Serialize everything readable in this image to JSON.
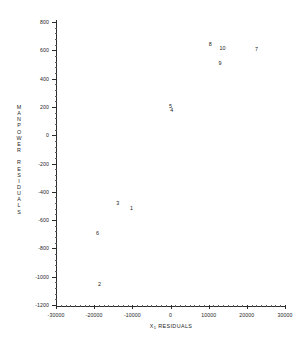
{
  "chart_data": {
    "type": "scatter",
    "title": "",
    "xlabel": "X₁ RESIDUALS",
    "xlabel_base": "X",
    "xlabel_sub": "1",
    "xlabel_rest": " RESIDUALS",
    "ylabel": "MANPOWER RESIDUALS",
    "ylabel_letters": [
      "M",
      "A",
      "N",
      "P",
      "O",
      "W",
      "E",
      "R",
      "",
      "R",
      "E",
      "S",
      "I",
      "D",
      "U",
      "A",
      "L",
      "S"
    ],
    "xlim": [
      -30000,
      30000
    ],
    "ylim": [
      -1200,
      800
    ],
    "xticks": [
      -30000,
      -20000,
      -10000,
      0,
      10000,
      20000,
      30000
    ],
    "xticklabels": [
      "-30000",
      "-20000",
      "-10000",
      "0",
      "10000",
      "20000",
      "30000"
    ],
    "yticks": [
      800,
      600,
      400,
      200,
      0,
      -200,
      -400,
      -600,
      -800,
      -1000,
      -1200
    ],
    "yticklabels": [
      "800",
      "600",
      "400",
      "200",
      "0",
      "-200",
      "-400",
      "-600",
      "-800",
      "-1000",
      "-1200"
    ],
    "x_minor_tick_count": 5,
    "y_minor_tick_count": 5,
    "grid": false,
    "legend": false,
    "marker_style": "text-label",
    "points": [
      {
        "label": "1",
        "x": -10200,
        "y": -515
      },
      {
        "label": "2",
        "x": -18600,
        "y": -1050
      },
      {
        "label": "3",
        "x": -13800,
        "y": -480
      },
      {
        "label": "4",
        "x": 300,
        "y": 180
      },
      {
        "label": "5",
        "x": 0,
        "y": 208
      },
      {
        "label": "6",
        "x": -19100,
        "y": -690
      },
      {
        "label": "7",
        "x": 22500,
        "y": 610
      },
      {
        "label": "8",
        "x": 10400,
        "y": 643
      },
      {
        "label": "9",
        "x": 13000,
        "y": 508
      },
      {
        "label": "10",
        "x": 13600,
        "y": 618
      }
    ]
  },
  "colors": {
    "background": "#ffffff",
    "axis": "#2b2b2b",
    "text": "#262626",
    "point": "#1a1a1a"
  }
}
